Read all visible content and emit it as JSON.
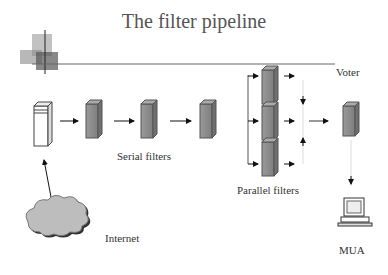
{
  "slide": {
    "title": "The filter pipeline",
    "labels": {
      "voter": "Voter",
      "serial_filters": "Serial filters",
      "parallel_filters": "Parallel filters",
      "internet": "Internet",
      "mua": "MUA"
    }
  },
  "colors": {
    "filter_box": "#8c8c8c",
    "cloud": "#bdbdbd",
    "text": "#333333"
  }
}
